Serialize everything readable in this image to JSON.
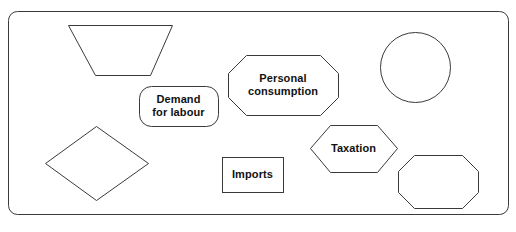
{
  "diagram": {
    "background_color": "#ffffff",
    "stroke_color": "#3a3a3a",
    "text_color": "#111111",
    "frame": {
      "name": "outer-frame",
      "x": 8,
      "y": 11,
      "width": 500,
      "height": 203,
      "corner_radius": 9
    },
    "shapes": [
      {
        "id": "trapezoid",
        "kind": "trapezoid",
        "label": "",
        "points": "68,25 172,25 150,75 95,75",
        "label_x": 0,
        "label_y": 0,
        "label_width": 0
      },
      {
        "id": "rounded-rectangle",
        "kind": "rounded-rectangle",
        "label": "Demand\nfor labour",
        "x": 139,
        "y": 86,
        "width": 79,
        "height": 40,
        "corner_radius": 12,
        "label_x": 139,
        "label_y": 93,
        "label_width": 79
      },
      {
        "id": "octagon-personal-consumption",
        "kind": "octagon",
        "label": "Personal\nconsumption",
        "points": "246,55 320,55 338,73 338,97 320,115 246,115 228,97 228,73",
        "label_x": 228,
        "label_y": 72,
        "label_width": 110
      },
      {
        "id": "circle",
        "kind": "circle",
        "label": "",
        "cx": 415,
        "cy": 67,
        "r": 35,
        "label_x": 0,
        "label_y": 0,
        "label_width": 0
      },
      {
        "id": "diamond",
        "kind": "diamond",
        "label": "",
        "points": "96,126 148,163 96,200 45,163",
        "label_x": 0,
        "label_y": 0,
        "label_width": 0
      },
      {
        "id": "rectangle-imports",
        "kind": "rectangle",
        "label": "Imports",
        "x": 222,
        "y": 157,
        "width": 61,
        "height": 35,
        "label_x": 222,
        "label_y": 168,
        "label_width": 61
      },
      {
        "id": "hexagon-taxation",
        "kind": "hexagon",
        "label": "Taxation",
        "points": "330,125 377,125 397,148 377,172 330,172 310,148",
        "label_x": 310,
        "label_y": 142,
        "label_width": 87
      },
      {
        "id": "octagon-plain",
        "kind": "octagon",
        "label": "",
        "points": "414,155 462,155 478,171 478,192 462,208 414,208 398,192 398,171",
        "label_x": 0,
        "label_y": 0,
        "label_width": 0
      }
    ]
  }
}
